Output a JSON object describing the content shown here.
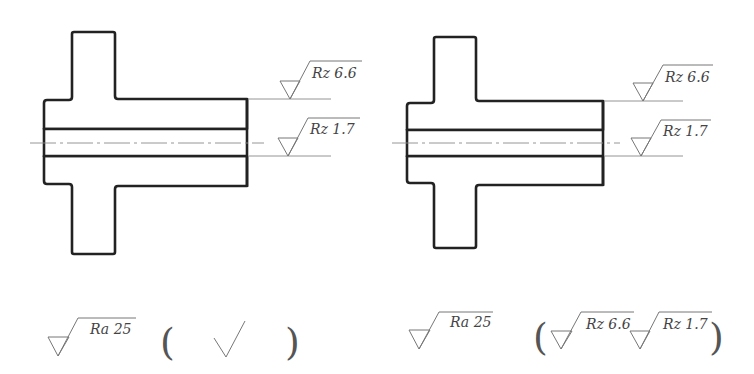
{
  "diagram": {
    "type": "engineering-drawing",
    "colors": {
      "outline": "#222222",
      "hatch": "#999999",
      "annotation": "#777777",
      "text": "#444444"
    }
  },
  "left_part": {
    "upper_surface_roughness": "Rz 6.6",
    "bore_surface_roughness": "Rz 1.7",
    "general_roughness": "Ra 25",
    "remaining_surfaces_symbol": "unmachined check mark (√)"
  },
  "right_part": {
    "upper_surface_roughness": "Rz 6.6",
    "bore_surface_roughness": "Rz 1.7",
    "general_roughness": "Ra 25",
    "remaining_surfaces": [
      "Rz 6.6",
      "Rz 1.7"
    ]
  },
  "labels": {
    "rz66": "Rz 6.6",
    "rz17": "Rz 1.7",
    "ra25": "Ra 25",
    "open_paren": "(",
    "close_paren": ")"
  }
}
